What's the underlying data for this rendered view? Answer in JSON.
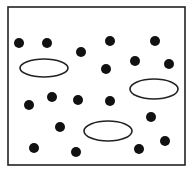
{
  "diagram": {
    "frame": {
      "x": 8,
      "y": 7,
      "width": 177,
      "height": 158,
      "stroke": "#222222",
      "stroke_width": 1.6
    },
    "dot_color": "#111111",
    "dot_radius": 5,
    "dots": [
      {
        "x": 19,
        "y": 43
      },
      {
        "x": 47,
        "y": 43
      },
      {
        "x": 81,
        "y": 52
      },
      {
        "x": 110,
        "y": 41
      },
      {
        "x": 155,
        "y": 41
      },
      {
        "x": 135,
        "y": 61
      },
      {
        "x": 169,
        "y": 64
      },
      {
        "x": 106,
        "y": 69
      },
      {
        "x": 29,
        "y": 105
      },
      {
        "x": 52,
        "y": 97
      },
      {
        "x": 78,
        "y": 100
      },
      {
        "x": 110,
        "y": 101
      },
      {
        "x": 151,
        "y": 117
      },
      {
        "x": 60,
        "y": 127
      },
      {
        "x": 34,
        "y": 148
      },
      {
        "x": 76,
        "y": 152
      },
      {
        "x": 139,
        "y": 149
      },
      {
        "x": 165,
        "y": 141
      }
    ],
    "ellipse_stroke": "#222222",
    "ellipses": [
      {
        "cx": 44,
        "cy": 68,
        "rx": 24,
        "ry": 9
      },
      {
        "cx": 154,
        "cy": 89,
        "rx": 24,
        "ry": 10
      },
      {
        "cx": 108,
        "cy": 131,
        "rx": 24,
        "ry": 10
      }
    ]
  }
}
